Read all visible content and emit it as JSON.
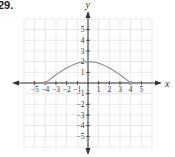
{
  "problem": {
    "label": "29."
  },
  "chart_data": {
    "type": "line",
    "title": "",
    "xlabel": "x",
    "ylabel": "y",
    "xlim": [
      -6,
      6
    ],
    "ylim": [
      -6,
      6
    ],
    "grid": true,
    "x_ticks": [
      -5,
      -4,
      -3,
      -2,
      -1,
      1,
      2,
      3,
      4,
      5
    ],
    "y_ticks": [
      5,
      4,
      3,
      2,
      1,
      -1,
      -2,
      -3,
      -4,
      -5
    ],
    "series": [
      {
        "name": "curve",
        "description": "smooth arch from (-4,0) up to peak (0,2) and down to (4,0); approx y = 2cos(pi*x/8)",
        "x": [
          -4,
          -3,
          -2,
          -1,
          0,
          1,
          2,
          3,
          4
        ],
        "y": [
          0,
          0.77,
          1.41,
          1.85,
          2,
          1.85,
          1.41,
          0.77,
          0
        ],
        "endpoints": [
          [
            -4,
            0
          ],
          [
            4,
            0
          ]
        ],
        "color": "#9a9a9a"
      }
    ],
    "axis_color": "#333333",
    "grid_color": "#e3e3e3"
  }
}
